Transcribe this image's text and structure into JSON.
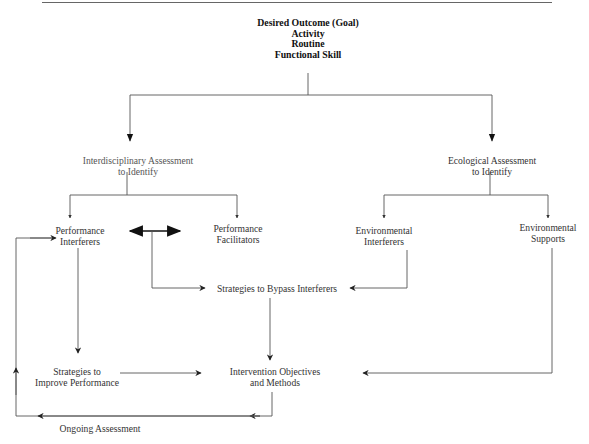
{
  "diagram": {
    "goal": {
      "lines": [
        "Desired Outcome (Goal)",
        "Activity",
        "Routine",
        "Functional Skill"
      ]
    },
    "interdisciplinary": {
      "lines": [
        "Interdisciplinary Assessment",
        "to Identify"
      ]
    },
    "ecological": {
      "lines": [
        "Ecological Assessment",
        "to Identify"
      ]
    },
    "performance_interferers": {
      "lines": [
        "Performance",
        "Interferers"
      ]
    },
    "performance_facilitators": {
      "lines": [
        "Performance",
        "Facilitators"
      ]
    },
    "environmental_interferers": {
      "lines": [
        "Environmental",
        "Interferers"
      ]
    },
    "environmental_supports": {
      "lines": [
        "Environmental",
        "Supports"
      ]
    },
    "bypass": {
      "lines": [
        "Strategies to Bypass Interferers"
      ]
    },
    "improve": {
      "lines": [
        "Strategies to",
        "Improve Performance"
      ]
    },
    "intervention": {
      "lines": [
        "Intervention Objectives",
        "and Methods"
      ]
    },
    "ongoing": {
      "lines": [
        "Ongoing Assessment"
      ]
    },
    "colors": {
      "line": "#555555",
      "text": "#333333"
    }
  }
}
